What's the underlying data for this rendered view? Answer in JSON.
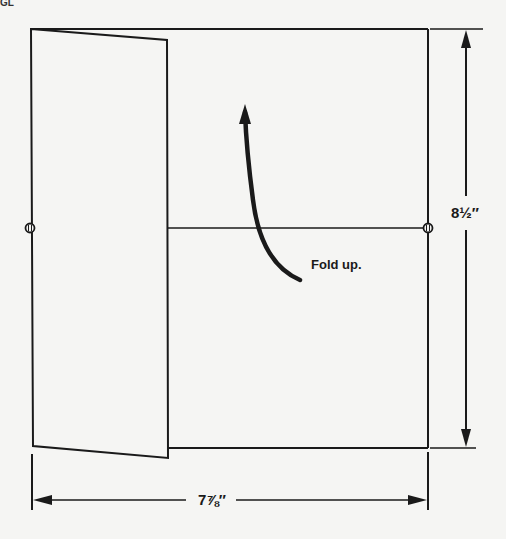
{
  "diagram": {
    "corner_fragment": "GL",
    "fold_instruction": "Fold up.",
    "height_dimension": "8½″",
    "width_dimension": "7⅞″",
    "colors": {
      "background": "#f5f5f3",
      "ink": "#1a1a1a"
    },
    "shapes": {
      "sheet_rect": {
        "x1": 167,
        "y1": 29,
        "x2": 428,
        "y2": 448
      },
      "flap": [
        [
          31,
          29
        ],
        [
          167,
          40
        ],
        [
          168,
          458
        ],
        [
          33,
          446
        ]
      ],
      "fold_line": {
        "x1": 167,
        "y1": 228,
        "x2": 428,
        "y2": 228
      },
      "pivot_markers": [
        [
          30,
          228
        ],
        [
          428,
          228
        ]
      ],
      "vertical_dimension": {
        "x": 466,
        "y1": 29,
        "y2": 448
      },
      "horizontal_dimension": {
        "y": 500,
        "x1": 33,
        "x2": 428
      }
    }
  }
}
